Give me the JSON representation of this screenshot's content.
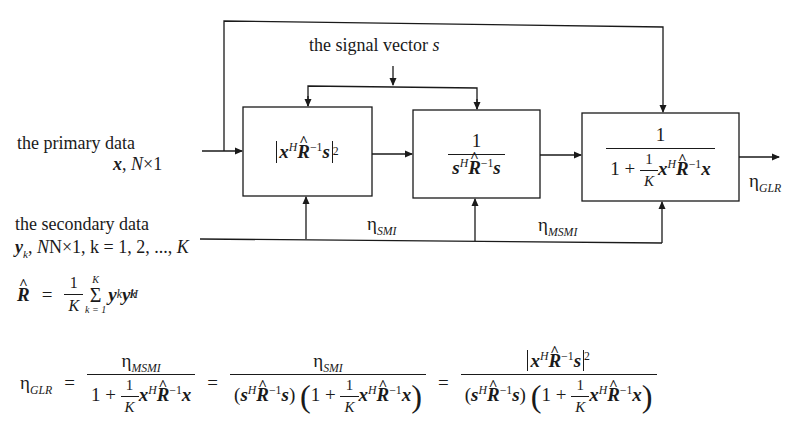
{
  "diagram": {
    "type": "block-diagram",
    "inputs": {
      "signal_vector": {
        "label": "the signal vector",
        "symbol": "s"
      },
      "primary_data": {
        "label": "the primary data",
        "symbol": "x",
        "dims": "N×1"
      },
      "secondary_data": {
        "label": "the secondary data",
        "symbol": "y",
        "sub": "k",
        "dims": "N×1, k = 1, 2, ..., ",
        "K": "K"
      }
    },
    "blocks": [
      {
        "id": "block-1",
        "expression": "|x^H R̂^-1 s|^2"
      },
      {
        "id": "block-2",
        "expression": "1 / (s^H R̂^-1 s)"
      },
      {
        "id": "block-3",
        "expression": "1 / (1 + (1/K) x^H R̂^-1 x)"
      }
    ],
    "outputs": {
      "eta_smi": {
        "symbol": "η",
        "sub": "SMI"
      },
      "eta_msmi": {
        "symbol": "η",
        "sub": "MSMI"
      },
      "eta_glr": {
        "symbol": "η",
        "sub": "GLR"
      }
    }
  },
  "sym": {
    "one": "1",
    "two": "2",
    "K": "K",
    "x": "x",
    "s": "s",
    "R": "R",
    "H": "H",
    "minus1": "−1",
    "plus": "+",
    "eq": "=",
    "eta": "η",
    "lp": "(",
    "rp": ")",
    "y": "y",
    "k": "k",
    "k_eq_1": "k = 1",
    "sigma": "Σ",
    "N": "N",
    "times1": "×1",
    "comma": ","
  },
  "equations": {
    "r_hat": "R̂ = (1/K) Σ_{k=1}^{K} y_k y_k^H",
    "eta_glr": "η_GLR = η_MSMI / (1 + (1/K) x^H R̂^-1 x) = η_SMI / ((s^H R̂^-1 s)(1 + (1/K) x^H R̂^-1 x)) = |x^H R̂^-1 s|^2 / ((s^H R̂^-1 s)(1 + (1/K) x^H R̂^-1 x))"
  }
}
